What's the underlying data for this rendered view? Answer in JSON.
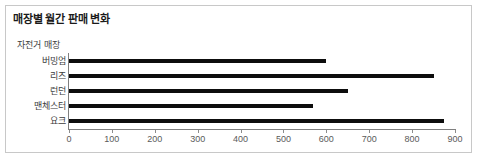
{
  "chart_data": {
    "type": "bar",
    "orientation": "horizontal",
    "title": "매장별 월간 판매 변화",
    "xlabel": "",
    "ylabel": "자전거 매장",
    "categories": [
      "버밍엄",
      "리즈",
      "런던",
      "맨체스터",
      "요크"
    ],
    "values": [
      600,
      850,
      650,
      570,
      875
    ],
    "series": [
      {
        "name": "월간 판매 변화",
        "values": [
          600,
          850,
          650,
          570,
          875
        ]
      }
    ],
    "xlim": [
      0,
      900
    ],
    "xticks": [
      0,
      100,
      200,
      300,
      400,
      500,
      600,
      700,
      800,
      900
    ],
    "xtick_labels": [
      "0",
      "100",
      "200",
      "300",
      "400",
      "500",
      "600",
      "700",
      "800",
      "900"
    ],
    "grid": false,
    "legend": false,
    "bar_color": "#0d0d0d",
    "axis_color": "#7f7f7f",
    "border_color": "#c8c8c8",
    "background": "#ffffff"
  }
}
